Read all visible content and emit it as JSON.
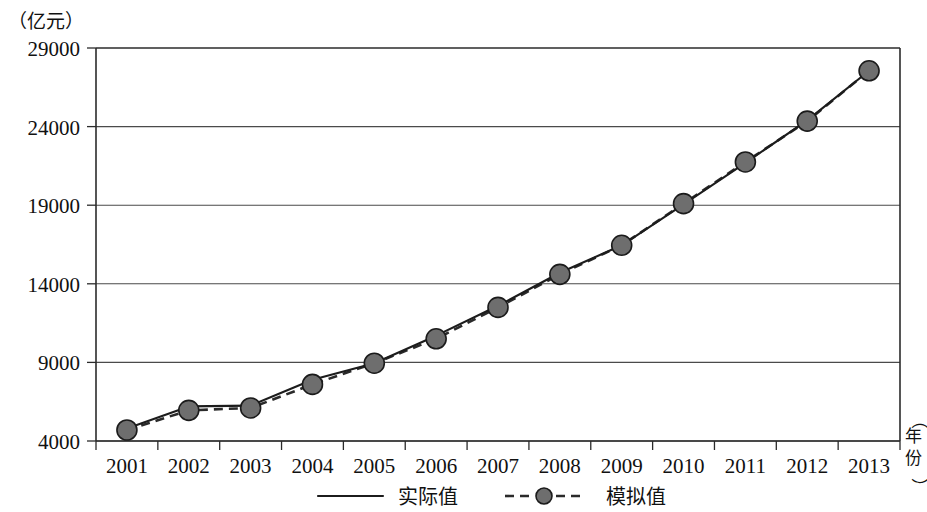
{
  "chart_data": {
    "type": "line",
    "title": "",
    "ylabel": "（亿元）",
    "xlabel": "（年份）",
    "categories": [
      "2001",
      "2002",
      "2003",
      "2004",
      "2005",
      "2006",
      "2007",
      "2008",
      "2009",
      "2010",
      "2011",
      "2012",
      "2013"
    ],
    "ylim": [
      4000,
      29000
    ],
    "yticks": [
      "4000",
      "9000",
      "14000",
      "19000",
      "24000",
      "29000"
    ],
    "ytick_values": [
      4000,
      9000,
      14000,
      19000,
      24000,
      29000
    ],
    "grid": true,
    "legend_position": "bottom",
    "series": [
      {
        "name": "实际值",
        "style": "solid",
        "marker": "none",
        "values": [
          4800,
          6200,
          6250,
          7900,
          8950,
          10700,
          12600,
          14700,
          16450,
          19050,
          21700,
          24400,
          27550
        ]
      },
      {
        "name": "模拟值",
        "style": "dashed",
        "marker": "circle",
        "values": [
          4700,
          5950,
          6100,
          7600,
          8950,
          10500,
          12500,
          14600,
          16450,
          19100,
          21750,
          24350,
          27550
        ]
      }
    ]
  },
  "axes": {
    "y_unit_label": "（亿元）",
    "x_unit_label": "（年份）",
    "x_unit_chars": [
      "（",
      "年",
      "份",
      "）"
    ]
  },
  "legend": {
    "items": [
      {
        "label": "实际值",
        "style": "solid",
        "marker": "none",
        "color": "#1c1c1c"
      },
      {
        "label": "模拟值",
        "style": "dashed",
        "marker": "circle",
        "color": "#2a2a2a",
        "marker_fill": "#6e6e6e"
      }
    ]
  },
  "colors": {
    "actual_line": "#1c1c1c",
    "simulated_line": "#2a2a2a",
    "marker_fill": "#6e6e6e",
    "marker_stroke": "#1b1b1b",
    "grid": "#4a4a4a",
    "frame": "#2b2b2b",
    "background": "#ffffff"
  }
}
